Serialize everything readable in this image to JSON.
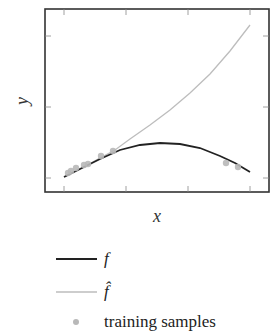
{
  "chart_data": {
    "type": "line",
    "title": "",
    "xlabel": "x",
    "ylabel": "y",
    "x_ticks": [
      "",
      "",
      "",
      ""
    ],
    "y_ticks": [
      "",
      "",
      ""
    ],
    "grid": false,
    "legend_position": "below",
    "series": [
      {
        "name": "f",
        "kind": "line",
        "color": "#222222",
        "points_px": [
          [
            64,
            177
          ],
          [
            80,
            169
          ],
          [
            100,
            159
          ],
          [
            120,
            150
          ],
          [
            140,
            145
          ],
          [
            160,
            143
          ],
          [
            180,
            144
          ],
          [
            200,
            148
          ],
          [
            220,
            156
          ],
          [
            235,
            163
          ],
          [
            250,
            172
          ]
        ]
      },
      {
        "name": "f̂",
        "kind": "line",
        "color": "#bdbdbd",
        "points_px": [
          [
            64,
            177
          ],
          [
            80,
            169
          ],
          [
            100,
            158
          ],
          [
            115,
            150
          ],
          [
            130,
            139
          ],
          [
            150,
            125
          ],
          [
            170,
            110
          ],
          [
            190,
            93
          ],
          [
            210,
            74
          ],
          [
            230,
            51
          ],
          [
            250,
            25
          ]
        ]
      },
      {
        "name": "training samples",
        "kind": "scatter",
        "color": "#b8b8b8",
        "points_px": [
          [
            68,
            173
          ],
          [
            71,
            171
          ],
          [
            76,
            168
          ],
          [
            84,
            165
          ],
          [
            88,
            164
          ],
          [
            101,
            156
          ],
          [
            113,
            151
          ],
          [
            226,
            163
          ],
          [
            238,
            167
          ]
        ]
      }
    ]
  },
  "legend": {
    "items": [
      {
        "label": "f"
      },
      {
        "label": "f̂"
      },
      {
        "label": "training samples"
      }
    ]
  },
  "axes": {
    "x_label": "x",
    "y_label": "y"
  }
}
